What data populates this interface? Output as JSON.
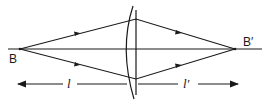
{
  "diagram": {
    "type": "thin lens ray diagram",
    "object_point": {
      "label": "B"
    },
    "image_point": {
      "label": "B′"
    },
    "object_distance": {
      "label": "l"
    },
    "image_distance": {
      "label": "l′"
    },
    "colors": {
      "line": "#1a1a1a",
      "background": "#ffffff"
    }
  }
}
